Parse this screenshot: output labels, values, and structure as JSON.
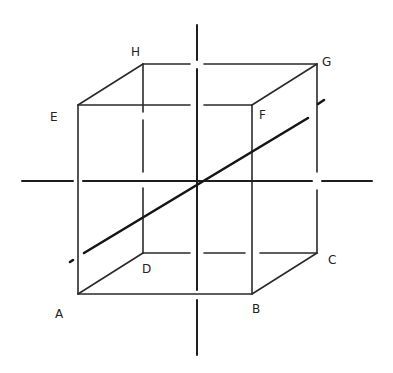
{
  "diagram": {
    "type": "cube-with-axes",
    "vertices": {
      "A": {
        "label": "A",
        "x": 78,
        "y": 294
      },
      "B": {
        "label": "B",
        "x": 252,
        "y": 294
      },
      "C": {
        "label": "C",
        "x": 317,
        "y": 253
      },
      "D": {
        "label": "D",
        "x": 143,
        "y": 253
      },
      "E": {
        "label": "E",
        "x": 78,
        "y": 105
      },
      "F": {
        "label": "F",
        "x": 252,
        "y": 105
      },
      "G": {
        "label": "G",
        "x": 317,
        "y": 64
      },
      "H": {
        "label": "H",
        "x": 143,
        "y": 64
      }
    },
    "labels": {
      "A": "A",
      "B": "B",
      "C": "C",
      "D": "D",
      "E": "E",
      "F": "F",
      "G": "G",
      "H": "H"
    },
    "colors": {
      "line": "#1e1e1e",
      "background": "#ffffff"
    }
  }
}
